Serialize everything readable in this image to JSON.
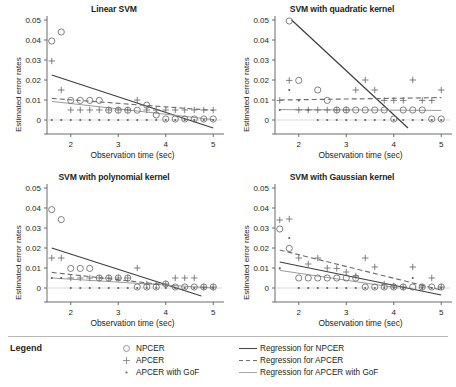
{
  "figure": {
    "ylabel": "Estimated error rates",
    "xlabel": "Observation time (sec)",
    "yticks": [
      "0",
      "0.01",
      "0.02",
      "0.03",
      "0.04",
      "0.05"
    ],
    "xticks": [
      "2",
      "3",
      "4",
      "5"
    ]
  },
  "legend": {
    "title": "Legend",
    "marker_items": [
      {
        "marker": "circle-marker",
        "label": "NPCER"
      },
      {
        "marker": "plus-marker",
        "label": "APCER"
      },
      {
        "marker": "dot-marker",
        "label": "APCER with GoF"
      }
    ],
    "line_items": [
      {
        "style": "solid-dark-line",
        "label": "Regression for NPCER"
      },
      {
        "style": "dashed-line",
        "label": "Regression for APCER"
      },
      {
        "style": "solid-light-line",
        "label": "Regression for APCER with GoF"
      }
    ]
  },
  "colors": {
    "axis": "#595959",
    "npcer_line": "#3f3f3f",
    "apcer_line": "#6d6d6d",
    "gof_line": "#9b9b9b",
    "marker": "#6a6a6a",
    "text": "#231f20",
    "rule": "#b8b8b8"
  },
  "chart_data": [
    {
      "type": "scatter",
      "title": "Linear SVM",
      "xlabel": "Observation time (sec)",
      "ylabel": "Estimated error rates",
      "xlim": [
        1.5,
        5.1
      ],
      "ylim": [
        -0.004,
        0.05
      ],
      "grid": false,
      "legend": "below-figure",
      "series": [
        {
          "name": "NPCER",
          "marker": "circle",
          "x": [
            1.6,
            1.8,
            2.0,
            2.2,
            2.4,
            2.6,
            2.8,
            3.0,
            3.2,
            3.4,
            3.6,
            3.8,
            4.0,
            4.2,
            4.4,
            4.6,
            4.8,
            5.0
          ],
          "y": [
            0.0395,
            0.044,
            0.0098,
            0.0098,
            0.0098,
            0.0098,
            0.0049,
            0.0049,
            0.0049,
            0.0049,
            0.0074,
            0.0025,
            0.0005,
            0.0005,
            0.0005,
            0.0005,
            0.0005,
            0.0005
          ]
        },
        {
          "name": "APCER",
          "marker": "plus",
          "x": [
            1.6,
            1.8,
            2.0,
            2.2,
            2.4,
            2.6,
            2.8,
            3.0,
            3.2,
            3.4,
            3.6,
            3.8,
            4.0,
            4.2,
            4.4,
            4.6,
            4.8,
            5.0
          ],
          "y": [
            0.0295,
            0.015,
            0.005,
            0.005,
            0.005,
            0.005,
            0.005,
            0.005,
            0.005,
            0.01,
            0.005,
            0.005,
            0.005,
            0.005,
            0.005,
            0.005,
            0.005,
            0.005
          ]
        },
        {
          "name": "APCER with GoF",
          "marker": "dot",
          "x": [
            1.6,
            1.8,
            2.0,
            2.2,
            2.4,
            2.6,
            2.8,
            3.0,
            3.2,
            3.4,
            3.6,
            3.8,
            4.0,
            4.2,
            4.4,
            4.6,
            4.8,
            5.0
          ],
          "y": [
            0.0,
            0.0,
            0.0,
            0.0,
            0.0,
            0.0,
            0.0,
            0.0,
            0.0,
            0.0,
            0.0,
            0.0,
            0.0,
            0.0,
            0.0,
            0.0,
            0.0,
            0.0
          ]
        }
      ],
      "regressions": [
        {
          "name": "Regression for NPCER",
          "style": "solid-dark",
          "x": [
            1.6,
            5.0
          ],
          "y": [
            0.0225,
            -0.004
          ]
        },
        {
          "name": "Regression for APCER",
          "style": "dashed",
          "x": [
            1.6,
            5.0
          ],
          "y": [
            0.0108,
            0.0048
          ]
        },
        {
          "name": "Regression for APCER with GoF",
          "style": "solid-light",
          "x": [
            1.6,
            5.0
          ],
          "y": [
            0.0093,
            0.0002
          ]
        }
      ]
    },
    {
      "type": "scatter",
      "title": "SVM with quadratic kernel",
      "xlabel": "Observation time (sec)",
      "ylabel": "Estimated error rates",
      "xlim": [
        1.5,
        5.1
      ],
      "ylim": [
        -0.004,
        0.05
      ],
      "grid": false,
      "legend": "below-figure",
      "series": [
        {
          "name": "NPCER",
          "marker": "circle",
          "x": [
            1.8,
            2.0,
            2.4,
            2.6,
            2.8,
            3.0,
            3.2,
            3.4,
            3.6,
            3.8,
            4.0,
            4.2,
            4.4,
            4.6,
            4.8,
            5.0
          ],
          "y": [
            0.0495,
            0.0198,
            0.015,
            0.0098,
            0.005,
            0.005,
            0.005,
            0.005,
            0.005,
            0.005,
            0.0005,
            0.005,
            0.005,
            0.005,
            0.0005,
            0.0005
          ]
        },
        {
          "name": "APCER",
          "marker": "plus",
          "x": [
            1.6,
            1.8,
            2.0,
            2.2,
            2.4,
            2.6,
            2.8,
            3.0,
            3.2,
            3.4,
            3.6,
            3.8,
            4.0,
            4.2,
            4.4,
            4.6,
            4.8,
            5.0
          ],
          "y": [
            0.0098,
            0.0198,
            0.005,
            0.005,
            0.005,
            0.005,
            0.005,
            0.005,
            0.015,
            0.02,
            0.015,
            0.0098,
            0.0098,
            0.0098,
            0.02,
            0.0098,
            0.0098,
            0.015
          ]
        },
        {
          "name": "APCER with GoF",
          "marker": "dot",
          "x": [
            1.6,
            1.8,
            2.0,
            2.2,
            2.4,
            2.6,
            2.8,
            3.0,
            3.2,
            3.4,
            3.6,
            3.8,
            4.0,
            4.2,
            4.4,
            4.6,
            4.8,
            5.0
          ],
          "y": [
            0.005,
            0.015,
            0.0098,
            0.005,
            0.0,
            0.0,
            0.0,
            0.0,
            0.0,
            0.0,
            0.0,
            0.0,
            0.0,
            0.0,
            0.0,
            0.0,
            0.0,
            0.0
          ]
        }
      ],
      "regressions": [
        {
          "name": "Regression for NPCER",
          "style": "solid-dark",
          "x": [
            1.85,
            4.3
          ],
          "y": [
            0.05,
            -0.004
          ]
        },
        {
          "name": "Regression for APCER",
          "style": "dashed",
          "x": [
            1.6,
            5.0
          ],
          "y": [
            0.01,
            0.0112
          ]
        },
        {
          "name": "Regression for APCER with GoF",
          "style": "solid-light",
          "x": [
            1.6,
            5.0
          ],
          "y": [
            0.0052,
            0.0048
          ]
        }
      ]
    },
    {
      "type": "scatter",
      "title": "SVM with polynomial kernel",
      "xlabel": "Observation time (sec)",
      "ylabel": "Estimated error rates",
      "xlim": [
        1.5,
        5.1
      ],
      "ylim": [
        -0.004,
        0.05
      ],
      "grid": false,
      "legend": "below-figure",
      "series": [
        {
          "name": "NPCER",
          "marker": "circle",
          "x": [
            1.6,
            1.8,
            2.0,
            2.2,
            2.4,
            2.6,
            2.8,
            3.0,
            3.2,
            3.4,
            3.6,
            3.8,
            4.0,
            4.2,
            4.4,
            4.6,
            4.8,
            5.0
          ],
          "y": [
            0.0392,
            0.0342,
            0.0098,
            0.0098,
            0.0098,
            0.005,
            0.005,
            0.005,
            0.005,
            0.0005,
            0.0005,
            0.0005,
            0.002,
            0.0005,
            0.0005,
            0.0005,
            0.0005,
            0.0005
          ]
        },
        {
          "name": "APCER",
          "marker": "plus",
          "x": [
            1.6,
            1.8,
            2.0,
            2.2,
            2.4,
            2.6,
            2.8,
            3.0,
            3.2,
            3.4,
            3.6,
            3.8,
            4.0,
            4.2,
            4.4,
            4.6,
            4.8,
            5.0
          ],
          "y": [
            0.015,
            0.015,
            0.005,
            0.005,
            0.005,
            0.005,
            0.005,
            0.005,
            0.005,
            0.01,
            0.002,
            0.002,
            0.002,
            0.005,
            0.005,
            0.005,
            0.0005,
            0.0005
          ]
        },
        {
          "name": "APCER with GoF",
          "marker": "dot",
          "x": [
            1.6,
            1.8,
            2.0,
            2.2,
            2.4,
            2.6,
            2.8,
            3.0,
            3.2,
            3.4,
            3.6,
            3.8,
            4.0,
            4.2,
            4.4,
            4.6,
            4.8,
            5.0
          ],
          "y": [
            0.005,
            0.005,
            0.0,
            0.0,
            0.0,
            0.0,
            0.0,
            0.0,
            0.0,
            0.0,
            0.0,
            0.0,
            0.0,
            0.0,
            0.0,
            0.0,
            0.0,
            0.0
          ]
        }
      ],
      "regressions": [
        {
          "name": "Regression for NPCER",
          "style": "solid-dark",
          "x": [
            1.6,
            4.75
          ],
          "y": [
            0.02,
            -0.004
          ]
        },
        {
          "name": "Regression for APCER",
          "style": "dashed",
          "x": [
            1.6,
            4.2
          ],
          "y": [
            0.0078,
            0.001
          ]
        },
        {
          "name": "Regression for APCER with GoF",
          "style": "solid-light",
          "x": [
            1.6,
            5.0
          ],
          "y": [
            0.005,
            0.0
          ]
        }
      ]
    },
    {
      "type": "scatter",
      "title": "SVM with Gaussian kernel",
      "xlabel": "Observation time (sec)",
      "ylabel": "Estimated error rates",
      "xlim": [
        1.5,
        5.1
      ],
      "ylim": [
        -0.004,
        0.05
      ],
      "grid": false,
      "legend": "below-figure",
      "series": [
        {
          "name": "NPCER",
          "marker": "circle",
          "x": [
            1.6,
            1.8,
            2.0,
            2.2,
            2.4,
            2.6,
            2.8,
            3.0,
            3.2,
            3.4,
            3.6,
            3.8,
            4.0,
            4.2,
            4.4,
            4.6,
            4.8,
            5.0
          ],
          "y": [
            0.0295,
            0.0198,
            0.005,
            0.005,
            0.005,
            0.005,
            0.005,
            0.005,
            0.005,
            0.0005,
            0.0005,
            0.0005,
            0.0005,
            0.0005,
            0.0005,
            0.0005,
            0.0005,
            0.0005
          ]
        },
        {
          "name": "APCER",
          "marker": "plus",
          "x": [
            1.6,
            1.8,
            2.0,
            2.2,
            2.4,
            2.6,
            2.8,
            3.0,
            3.2,
            3.4,
            3.6,
            3.8,
            4.0,
            4.2,
            4.4,
            4.6,
            4.8,
            5.0
          ],
          "y": [
            0.034,
            0.0345,
            0.015,
            0.012,
            0.015,
            0.01,
            0.0098,
            0.008,
            0.006,
            0.015,
            0.0105,
            0.002,
            0.001,
            0.0005,
            0.0105,
            0.0005,
            0.005,
            0.0005
          ]
        },
        {
          "name": "APCER with GoF",
          "marker": "dot",
          "x": [
            1.6,
            1.8,
            2.0,
            2.2,
            2.4,
            2.6,
            2.8,
            3.0,
            3.2,
            3.4,
            3.6,
            3.8,
            4.0,
            4.2,
            4.4,
            4.6,
            4.8,
            5.0
          ],
          "y": [
            0.0098,
            0.025,
            0.0,
            0.0,
            0.0,
            0.0,
            0.0,
            0.0,
            0.0,
            0.0,
            0.0,
            0.0,
            0.0,
            0.0,
            0.005,
            0.0,
            0.0,
            0.0
          ]
        }
      ],
      "regressions": [
        {
          "name": "Regression for NPCER",
          "style": "solid-dark",
          "x": [
            1.6,
            5.0
          ],
          "y": [
            0.013,
            -0.0035
          ]
        },
        {
          "name": "Regression for APCER",
          "style": "dashed",
          "x": [
            1.6,
            5.0
          ],
          "y": [
            0.019,
            -0.001
          ]
        },
        {
          "name": "Regression for APCER with GoF",
          "style": "solid-light",
          "x": [
            1.6,
            4.1
          ],
          "y": [
            0.0088,
            0.0
          ]
        }
      ]
    }
  ]
}
